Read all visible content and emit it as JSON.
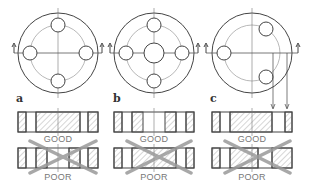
{
  "panels": [
    {
      "id": "a",
      "label": "a",
      "good_label": "GOOD",
      "poor_label": "POOR",
      "cx": 58,
      "layout": "four-holes"
    },
    {
      "id": "b",
      "label": "b",
      "good_label": "GOOD",
      "poor_label": "POOR",
      "cx": 154,
      "layout": "four-holes-center-bore"
    },
    {
      "id": "c",
      "label": "c",
      "good_label": "GOOD",
      "poor_label": "POOR",
      "cx": 252,
      "layout": "three-holes-offset"
    }
  ],
  "colors": {
    "line": "#444444",
    "hatch": "#888888",
    "cross": "#9a9a9a",
    "centerline": "#777777"
  }
}
